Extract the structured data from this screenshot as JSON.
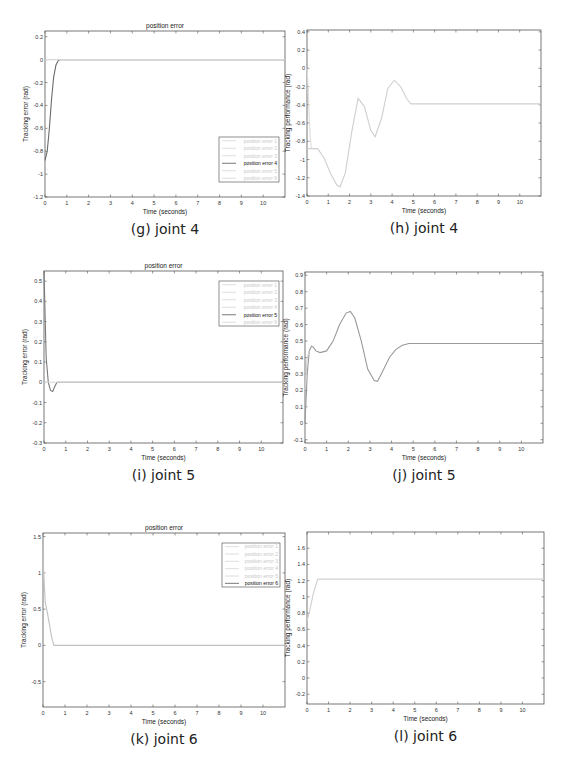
{
  "chart_data": [
    {
      "id": "g",
      "type": "line",
      "caption": "(g) joint 4",
      "title": "position error",
      "xlabel": "Time (seconds)",
      "ylabel": "Tracking error (rad)",
      "xlim": [
        0,
        11
      ],
      "ylim": [
        -1.2,
        0.25
      ],
      "xticks": [
        0,
        1,
        2,
        3,
        4,
        5,
        6,
        7,
        8,
        9,
        10
      ],
      "yticks": [
        0.2,
        0,
        -0.2,
        -0.4,
        -0.6,
        -0.8,
        -1,
        -1.2
      ],
      "ytick_labels": [
        "0.2",
        "0",
        "-0.2",
        "-0.4",
        "-0.6",
        "-0.8",
        "-1",
        "-1.2"
      ],
      "legend": [
        "position error 1",
        "position error 2",
        "position error 3",
        "position error 4",
        "position error 5",
        "position error 6"
      ],
      "legend_active": 3,
      "legend_position": "lower right",
      "box": {
        "x": 45,
        "y": 31,
        "w": 240,
        "h": 166
      },
      "legend_box": {
        "x": 219,
        "y": 137,
        "w": 60,
        "h": 45
      },
      "series": [
        {
          "name": "position error 4",
          "color": "#6a6a6a",
          "x": [
            0,
            0.1,
            0.2,
            0.3,
            0.4,
            0.5,
            0.6,
            0.7,
            0.8,
            1,
            2,
            3,
            4,
            5,
            6,
            7,
            8,
            9,
            10,
            11
          ],
          "y": [
            -0.88,
            -0.8,
            -0.6,
            -0.35,
            -0.15,
            -0.05,
            -0.01,
            0,
            0,
            0,
            0,
            0,
            0,
            0,
            0,
            0,
            0,
            0,
            0,
            0
          ]
        },
        {
          "name": "position error (others)",
          "color": "#d8d8d8",
          "x": [
            0,
            11
          ],
          "y": [
            0,
            0
          ]
        }
      ]
    },
    {
      "id": "h",
      "type": "line",
      "caption": "(h) joint 4",
      "title": "",
      "xlabel": "Time (seconds)",
      "ylabel": "Tracking performance (rad)",
      "xlim": [
        0,
        11
      ],
      "ylim": [
        -1.4,
        0.42
      ],
      "xticks": [
        0,
        1,
        2,
        3,
        4,
        5,
        6,
        7,
        8,
        9,
        10
      ],
      "yticks": [
        0.4,
        0.2,
        0,
        -0.2,
        -0.4,
        -0.6,
        -0.8,
        -1,
        -1.2,
        -1.4
      ],
      "ytick_labels": [
        "0.4",
        "0.2",
        "0",
        "-0.2",
        "-0.4",
        "-0.6",
        "-0.8",
        "-1",
        "-1.2",
        "-1.4"
      ],
      "legend": [],
      "box": {
        "x": 307,
        "y": 30,
        "w": 234,
        "h": 166
      },
      "series": [
        {
          "name": "actual",
          "color": "#cfcfcf",
          "x": [
            0,
            0.5,
            0.8,
            1.1,
            1.4,
            1.55,
            1.8,
            2.1,
            2.4,
            2.7,
            3.0,
            3.2,
            3.5,
            3.8,
            4.1,
            4.4,
            4.7,
            4.9,
            6,
            8,
            10,
            11
          ],
          "y": [
            -0.88,
            -0.88,
            -0.98,
            -1.15,
            -1.28,
            -1.3,
            -1.15,
            -0.7,
            -0.33,
            -0.42,
            -0.68,
            -0.75,
            -0.55,
            -0.22,
            -0.13,
            -0.2,
            -0.34,
            -0.39,
            -0.39,
            -0.39,
            -0.39,
            -0.39
          ]
        },
        {
          "name": "reference",
          "color": "#dcdcdc",
          "x": [
            0,
            0.05,
            0.1,
            0.15,
            0.2
          ],
          "y": [
            0,
            -0.2,
            -0.5,
            -0.75,
            -0.88
          ]
        }
      ]
    },
    {
      "id": "i",
      "type": "line",
      "caption": "(i) joint 5",
      "title": "position error",
      "xlabel": "Time (seconds)",
      "ylabel": "Tracking error (rad)",
      "xlim": [
        0,
        11
      ],
      "ylim": [
        -0.3,
        0.55
      ],
      "xticks": [
        0,
        1,
        2,
        3,
        4,
        5,
        6,
        7,
        8,
        9,
        10
      ],
      "yticks": [
        0.5,
        0.4,
        0.3,
        0.2,
        0.1,
        0,
        -0.1,
        -0.2,
        -0.3
      ],
      "ytick_labels": [
        "0.5",
        "0.4",
        "0.3",
        "0.2",
        "0.1",
        "0",
        "-0.1",
        "-0.2",
        "-0.3"
      ],
      "legend": [
        "position error 1",
        "position error 2",
        "position error 3",
        "position error 4",
        "position error 5",
        "position error 6"
      ],
      "legend_active": 4,
      "legend_position": "upper right",
      "box": {
        "x": 44,
        "y": 271,
        "w": 239,
        "h": 172
      },
      "legend_box": {
        "x": 219,
        "y": 281,
        "w": 60,
        "h": 45
      },
      "series": [
        {
          "name": "position error 5",
          "color": "#7a7a7a",
          "x": [
            0,
            0.1,
            0.2,
            0.3,
            0.4,
            0.5,
            0.6,
            0.8,
            1,
            2,
            3,
            4,
            5,
            6,
            7,
            8,
            9,
            10,
            11
          ],
          "y": [
            0.55,
            0.12,
            0.0,
            -0.04,
            -0.045,
            -0.02,
            0,
            0,
            0,
            0,
            0,
            0,
            0,
            0,
            0,
            0,
            0,
            0,
            0
          ]
        },
        {
          "name": "position error (others)",
          "color": "#d8d8d8",
          "x": [
            0,
            11
          ],
          "y": [
            0,
            0
          ]
        }
      ]
    },
    {
      "id": "j",
      "type": "line",
      "caption": "(j) joint 5",
      "title": "",
      "xlabel": "Time (seconds)",
      "ylabel": "Tracking performance (rad)",
      "xlim": [
        0,
        11
      ],
      "ylim": [
        -0.12,
        0.92
      ],
      "xticks": [
        0,
        1,
        2,
        3,
        4,
        5,
        6,
        7,
        8,
        9,
        10
      ],
      "yticks": [
        0.9,
        0.8,
        0.7,
        0.6,
        0.5,
        0.4,
        0.3,
        0.2,
        0.1,
        0,
        -0.1
      ],
      "ytick_labels": [
        "0.9",
        "0.8",
        "0.7",
        "0.6",
        "0.5",
        "0.4",
        "0.3",
        "0.2",
        "0.1",
        "0",
        "-0.1"
      ],
      "legend": [],
      "box": {
        "x": 305,
        "y": 272,
        "w": 238,
        "h": 171
      },
      "series": [
        {
          "name": "actual",
          "color": "#9a9a9a",
          "x": [
            0,
            0.1,
            0.2,
            0.3,
            0.4,
            0.5,
            0.7,
            1.0,
            1.3,
            1.6,
            1.9,
            2.1,
            2.3,
            2.6,
            2.9,
            3.2,
            3.35,
            3.6,
            3.9,
            4.2,
            4.5,
            4.8,
            5,
            7,
            9,
            11
          ],
          "y": [
            0,
            0.3,
            0.44,
            0.47,
            0.46,
            0.44,
            0.43,
            0.44,
            0.5,
            0.6,
            0.67,
            0.68,
            0.64,
            0.5,
            0.33,
            0.26,
            0.255,
            0.32,
            0.4,
            0.45,
            0.475,
            0.485,
            0.485,
            0.485,
            0.485,
            0.485
          ]
        },
        {
          "name": "reference",
          "color": "#d0d0d0",
          "x": [
            0,
            0.1,
            0.2
          ],
          "y": [
            0.2,
            0.4,
            0.44
          ]
        }
      ]
    },
    {
      "id": "k",
      "type": "line",
      "caption": "(k) joint 6",
      "title": "position error",
      "xlabel": "Time (seconds)",
      "ylabel": "Tracking error (rad)",
      "xlim": [
        0,
        11
      ],
      "ylim": [
        -0.85,
        1.55
      ],
      "xticks": [
        0,
        1,
        2,
        3,
        4,
        5,
        6,
        7,
        8,
        9,
        10
      ],
      "yticks": [
        1.5,
        1,
        0.5,
        0,
        -0.5
      ],
      "ytick_labels": [
        "1.5",
        "1",
        "0.5",
        "0",
        "-0.5"
      ],
      "legend": [
        "position error 1",
        "position error 2",
        "position error 3",
        "position error 4",
        "position error 5",
        "position error 6"
      ],
      "legend_active": 5,
      "legend_position": "upper right",
      "box": {
        "x": 43,
        "y": 533,
        "w": 242,
        "h": 174
      },
      "legend_box": {
        "x": 222,
        "y": 543,
        "w": 58,
        "h": 44
      },
      "series": [
        {
          "name": "position error 6",
          "color": "#c0c0c0",
          "x": [
            0,
            0.1,
            0.2,
            0.3,
            0.4,
            0.5,
            1,
            2,
            3,
            4,
            5,
            6,
            7,
            8,
            9,
            10,
            11
          ],
          "y": [
            1.2,
            0.6,
            0.45,
            0.28,
            0.1,
            0,
            0,
            0,
            0,
            0,
            0,
            0,
            0,
            0,
            0,
            0,
            0
          ]
        }
      ]
    },
    {
      "id": "l",
      "type": "line",
      "caption": "(l) joint 6",
      "title": "",
      "xlabel": "Time (seconds)",
      "ylabel": "Tracking performance (rad)",
      "xlim": [
        0,
        11
      ],
      "ylim": [
        -0.32,
        1.8
      ],
      "xticks": [
        0,
        1,
        2,
        3,
        4,
        5,
        6,
        7,
        8,
        9,
        10
      ],
      "yticks": [
        1.6,
        1.4,
        1.2,
        1,
        0.8,
        0.6,
        0.4,
        0.2,
        0,
        -0.2
      ],
      "ytick_labels": [
        "1.6",
        "1.4",
        "1.2",
        "1",
        "0.8",
        "0.6",
        "0.4",
        "0.2",
        "0",
        "-0.2"
      ],
      "legend": [],
      "box": {
        "x": 307,
        "y": 532,
        "w": 237,
        "h": 172
      },
      "series": [
        {
          "name": "actual",
          "color": "#cfcfcf",
          "x": [
            0,
            0.1,
            0.3,
            0.5,
            1,
            2,
            4,
            6,
            8,
            10,
            11
          ],
          "y": [
            0.7,
            0.8,
            1.05,
            1.22,
            1.22,
            1.22,
            1.22,
            1.22,
            1.22,
            1.22,
            1.22
          ]
        }
      ]
    }
  ]
}
